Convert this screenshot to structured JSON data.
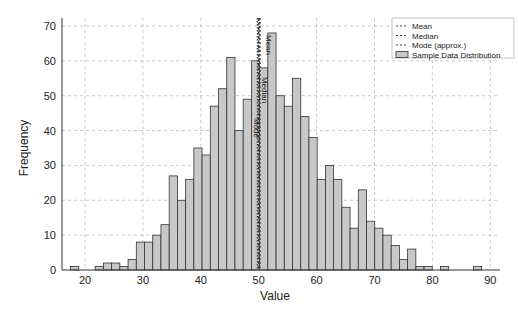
{
  "chart_data": {
    "type": "bar",
    "title": "",
    "xlabel": "Value",
    "ylabel": "Frequency",
    "xlim": [
      15,
      92
    ],
    "ylim": [
      0,
      72
    ],
    "xticks": [
      20,
      30,
      40,
      50,
      60,
      70,
      80,
      90
    ],
    "yticks": [
      0,
      10,
      20,
      30,
      40,
      50,
      60,
      70
    ],
    "grid": true,
    "legend_position": "upper right",
    "bin_start": 17.5,
    "bin_width": 1.42,
    "series": [
      {
        "name": "Sample Data Distribution",
        "values": [
          1,
          0,
          0,
          1,
          2,
          2,
          1,
          3,
          8,
          8,
          10,
          13,
          27,
          20,
          26,
          35,
          33,
          47,
          52,
          61,
          40,
          49,
          60,
          58,
          68,
          50,
          47,
          55,
          44,
          38,
          26,
          30,
          26,
          18,
          12,
          23,
          14,
          12,
          10,
          7,
          3,
          6,
          1,
          1,
          0,
          1,
          0,
          0,
          0,
          1
        ]
      }
    ],
    "reference_lines": [
      {
        "name": "Mean",
        "value": 50.2,
        "label": "Mean"
      },
      {
        "name": "Median",
        "value": 50.0,
        "label": "Median"
      },
      {
        "name": "Mode (approx.)",
        "value": 49.8,
        "label": "Mode"
      }
    ]
  },
  "legend": {
    "items": [
      {
        "label": "Mean",
        "kind": "dash"
      },
      {
        "label": "Median",
        "kind": "dash"
      },
      {
        "label": "Mode (approx.)",
        "kind": "dash"
      },
      {
        "label": "Sample Data Distribution",
        "kind": "box"
      }
    ]
  },
  "colors": {
    "bar_fill": "#c8c8c8",
    "bar_edge": "#333333",
    "grid": "#bbbbbb",
    "line": "#444444"
  }
}
